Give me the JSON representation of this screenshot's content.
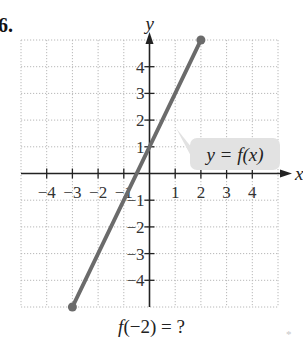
{
  "problem": {
    "number": "6.",
    "question_func": "f",
    "question_rest": "(−2) = ?",
    "footnote_marker": "*"
  },
  "chart_data": {
    "type": "line",
    "title": "",
    "xlabel": "x",
    "ylabel": "y",
    "xlim": [
      -5,
      5
    ],
    "ylim": [
      -5,
      5
    ],
    "grid": true,
    "x_tick_labels": [
      "−4",
      "−3",
      "−2",
      "−1",
      "1",
      "2",
      "3",
      "4"
    ],
    "y_tick_labels": [
      "4",
      "3",
      "2",
      "1",
      "−1",
      "−2",
      "−3",
      "−4"
    ],
    "series": [
      {
        "name": "y = f(x)",
        "x": [
          -3,
          2
        ],
        "y": [
          -5,
          5
        ],
        "endpoints": "closed",
        "color": "#6b6b6b"
      }
    ],
    "annotations": [
      {
        "text": "y = f(x)",
        "style": "callout-box",
        "fill": "#e2e2e2"
      }
    ]
  },
  "labels": {
    "x_axis": "x",
    "y_axis": "y",
    "callout": "y = f(x)"
  }
}
